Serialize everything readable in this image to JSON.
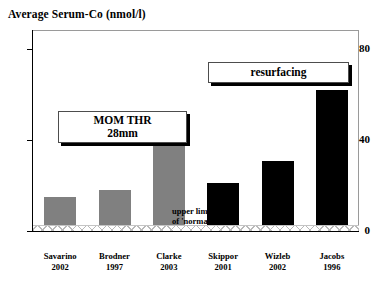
{
  "chart_data": {
    "type": "bar",
    "title": "Average Serum-Co  (nmol/l)",
    "xlabel": "",
    "ylabel": "Average Serum-Co (nmol/l)",
    "ylim": [
      0,
      88
    ],
    "yticks": [
      0,
      40,
      80
    ],
    "ytick_labels": [
      "0",
      "40",
      "80"
    ],
    "grid": false,
    "legend": "none",
    "categories": [
      "Savarino 2002",
      "Brodner 1997",
      "Clarke 2003",
      "Skippor 2001",
      "Wizleb 2002",
      "Jacobs 1996"
    ],
    "values": [
      15,
      18,
      38,
      21,
      31,
      62
    ],
    "bar_colors": [
      "#808080",
      "#808080",
      "#808080",
      "#000000",
      "#000000",
      "#000000"
    ],
    "groups": [
      {
        "name": "MOM THR 28mm",
        "color": "#808080",
        "categories": [
          "Savarino 2002",
          "Brodner 1997",
          "Clarke 2003"
        ]
      },
      {
        "name": "resurfacing",
        "color": "#000000",
        "categories": [
          "Skippor 2001",
          "Wizleb 2002",
          "Jacobs 1996"
        ]
      }
    ],
    "annotations": [
      {
        "text": "MOM THR 28mm",
        "type": "callout-box"
      },
      {
        "text": "resurfacing",
        "type": "callout-box"
      },
      {
        "text": "upper limit of 'normal'",
        "type": "text-note",
        "band_value": 3
      }
    ]
  },
  "title": "Average Serum-Co  (nmol/l)",
  "y_axis": {
    "ticks": [
      {
        "label": "80",
        "value": 80
      },
      {
        "label": "40",
        "value": 40
      },
      {
        "label": "0",
        "value": 0
      }
    ]
  },
  "bars": [
    {
      "label_line1": "Savarino",
      "label_line2": "2002",
      "value": 15,
      "color": "#808080"
    },
    {
      "label_line1": "Brodner",
      "label_line2": "1997",
      "value": 18,
      "color": "#808080"
    },
    {
      "label_line1": "Clarke",
      "label_line2": "2003",
      "value": 38,
      "color": "#808080"
    },
    {
      "label_line1": "Skippor",
      "label_line2": "2001",
      "value": 21,
      "color": "#000000"
    },
    {
      "label_line1": "Wizleb",
      "label_line2": "2002",
      "value": 31,
      "color": "#000000"
    },
    {
      "label_line1": "Jacobs",
      "label_line2": "1996",
      "value": 62,
      "color": "#000000"
    }
  ],
  "callouts": {
    "mom_thr_line1": "MOM THR",
    "mom_thr_line2": "28mm",
    "resurfacing": "resurfacing"
  },
  "notes": {
    "upper_limit_line1": "upper limit",
    "upper_limit_line2": "of 'normal'"
  },
  "colors": {
    "bar_gray": "#808080",
    "bar_black": "#000000",
    "axis": "#000000",
    "frame": "#9a9a9a",
    "band": "#b9b9b9"
  }
}
